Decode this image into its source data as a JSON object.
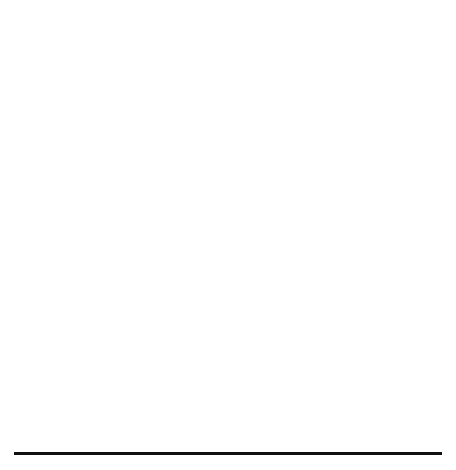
{
  "figure": {
    "panel_label": "(a)",
    "background": "#ffffff",
    "rule_color": "#111111"
  },
  "chart_data": [
    {
      "id": "top",
      "type": "line",
      "title": "",
      "xlabel": "Number of Rounds",
      "ylabel": "Objective Throughput",
      "xlim": [
        40,
        510
      ],
      "ylim": [
        167,
        231
      ],
      "xticks": [
        100,
        200,
        300,
        400,
        500
      ],
      "yticks": [
        170,
        180,
        190,
        200,
        210,
        220,
        230
      ],
      "grid": false,
      "legend_position": "top-right",
      "x": [
        50,
        100,
        150,
        200,
        250,
        300,
        350,
        400,
        450,
        500
      ],
      "series": [
        {
          "name": "CMPS",
          "marker": "triangle",
          "linestyle": "dashed",
          "color": "#333333",
          "values": [
            221.8,
            208.0,
            199.5,
            197.8,
            195.8,
            193.7,
            192.4,
            191.3,
            190.4,
            189.5
          ]
        },
        {
          "name": "CPS",
          "marker": "circle",
          "linestyle": "dotted",
          "color": "#333333",
          "values": [
            221.8,
            220.2,
            214.8,
            207.8,
            204.4,
            202.6,
            199.6,
            198.5,
            197.1,
            196.0
          ]
        },
        {
          "name": "FMPS",
          "marker": "square",
          "linestyle": "solid",
          "color": "#111111",
          "values": [
            224.8,
            208.0,
            199.3,
            189.9,
            183.7,
            178.5,
            172.3,
            167.8,
            null,
            null
          ]
        }
      ]
    },
    {
      "id": "bottom",
      "type": "line",
      "title": "",
      "xlabel": "Number of Rounds",
      "ylabel": "Fitness Evaluations",
      "xlim": [
        -20,
        520
      ],
      "ylim": [
        -0.6,
        12.9
      ],
      "xticks": [
        0,
        100,
        200,
        300,
        400,
        500
      ],
      "yticks": [
        0,
        2,
        4,
        6,
        8,
        10,
        12
      ],
      "grid": false,
      "legend_position": "top-left",
      "x": [
        0,
        50,
        100,
        150,
        200,
        250,
        300,
        350,
        400,
        450,
        500
      ],
      "series": [
        {
          "name": "CMPS",
          "marker": "circle",
          "linestyle": "solid",
          "color": "#111111",
          "values": [
            0.0,
            1.4,
            2.5,
            3.75,
            4.95,
            6.05,
            7.15,
            8.4,
            9.6,
            10.9,
            12.3
          ]
        },
        {
          "name": "CPS",
          "marker": "triangle",
          "linestyle": "solid",
          "color": "#111111",
          "values": [
            0.0,
            1.4,
            2.5,
            3.75,
            4.95,
            6.05,
            7.15,
            8.4,
            9.6,
            10.9,
            12.3
          ]
        },
        {
          "name": "FMPS",
          "marker": "square",
          "linestyle": "solid",
          "color": "#111111",
          "values": [
            0.0,
            1.4,
            2.5,
            3.75,
            4.95,
            6.05,
            7.15,
            8.4,
            9.6,
            10.9,
            12.3
          ]
        }
      ]
    }
  ],
  "top_chart": {
    "xlabel": "Number of Rounds",
    "ylabel": "Objective Throughput",
    "xticks": [
      "100",
      "200",
      "300",
      "400",
      "500"
    ],
    "yticks": [
      "170",
      "180",
      "190",
      "200",
      "210",
      "220",
      "230"
    ],
    "legend": [
      {
        "label": "CMPS",
        "marker": "triangle"
      },
      {
        "label": "CPS",
        "marker": "circle"
      },
      {
        "label": "FMPS",
        "marker": "square"
      }
    ]
  },
  "bottom_chart": {
    "xlabel": "Number of Rounds",
    "ylabel": "Fitness Evaluations",
    "xticks": [
      "0",
      "100",
      "200",
      "300",
      "400",
      "500"
    ],
    "yticks": [
      "0",
      "2",
      "4",
      "6",
      "8",
      "10",
      "12"
    ],
    "legend": [
      {
        "label": "CMPS",
        "marker": "circle"
      },
      {
        "label": "CPS",
        "marker": "triangle"
      },
      {
        "label": "FMPS",
        "marker": "square"
      }
    ]
  }
}
